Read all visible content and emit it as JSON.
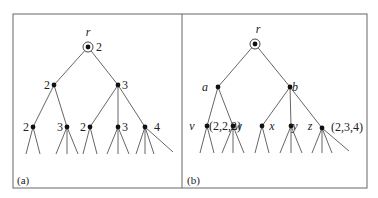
{
  "figure": {
    "frame": {
      "x": 13,
      "y": 14,
      "width": 354,
      "height": 174,
      "divider_x": 182
    },
    "panels": [
      {
        "id": "a",
        "caption": "(a)",
        "caption_pos": [
          17,
          184
        ],
        "nodes": [
          {
            "id": "r",
            "x": 88,
            "y": 47,
            "root": true,
            "label": "r",
            "label_pos": [
              88,
              36
            ],
            "label_style": "italic",
            "value": "2",
            "value_pos": [
              96,
              51
            ]
          },
          {
            "id": "L",
            "x": 54,
            "y": 85,
            "value": "2",
            "value_pos": [
              44,
              89
            ]
          },
          {
            "id": "R",
            "x": 118,
            "y": 85,
            "value": "3",
            "value_pos": [
              122,
              89
            ]
          },
          {
            "id": "LL",
            "x": 33,
            "y": 127,
            "value": "2",
            "value_pos": [
              23,
              131
            ]
          },
          {
            "id": "LR",
            "x": 67,
            "y": 127,
            "value": "3",
            "value_pos": [
              57,
              131
            ]
          },
          {
            "id": "RL",
            "x": 90,
            "y": 127,
            "value": "2",
            "value_pos": [
              80,
              131
            ]
          },
          {
            "id": "RM",
            "x": 118,
            "y": 127,
            "value": "3",
            "value_pos": [
              122,
              131
            ]
          },
          {
            "id": "RR",
            "x": 145,
            "y": 127,
            "value": "4",
            "value_pos": [
              154,
              131
            ]
          }
        ],
        "edges": [
          [
            "r",
            "L"
          ],
          [
            "r",
            "R"
          ],
          [
            "L",
            "LL"
          ],
          [
            "L",
            "LR"
          ],
          [
            "R",
            "RL"
          ],
          [
            "R",
            "RM"
          ],
          [
            "R",
            "RR"
          ]
        ],
        "leaf_stubs": [
          {
            "from": "LL",
            "dx": [
              -7,
              7
            ],
            "len": 27
          },
          {
            "from": "LR",
            "dx": [
              -11,
              0,
              11
            ],
            "len": 27
          },
          {
            "from": "RL",
            "dx": [
              -7,
              7
            ],
            "len": 27
          },
          {
            "from": "RM",
            "dx": [
              -11,
              0,
              11
            ],
            "len": 27
          },
          {
            "from": "RR",
            "dx": [
              -9,
              0,
              9,
              28
            ],
            "len": 27
          }
        ]
      },
      {
        "id": "b",
        "caption": "(b)",
        "caption_pos": [
          187,
          184
        ],
        "nodes": [
          {
            "id": "r",
            "x": 255,
            "y": 44,
            "root": true,
            "label": "r",
            "label_pos": [
              258,
              33
            ],
            "label_style": "italic"
          },
          {
            "id": "a",
            "x": 218,
            "y": 87,
            "label": "a",
            "label_pos": [
              205,
              91
            ],
            "label_style": "italic"
          },
          {
            "id": "b",
            "x": 290,
            "y": 87,
            "label": "b",
            "label_pos": [
              295,
              91
            ],
            "label_style": "italic"
          },
          {
            "id": "v",
            "x": 207,
            "y": 126,
            "label": "v",
            "label_pos": [
              192,
              130
            ],
            "label_style": "italic",
            "value": "(2,2,2)",
            "value_pos": [
              209,
              130
            ]
          },
          {
            "id": "w",
            "x": 233,
            "y": 126,
            "label": "w",
            "label_pos": [
              238,
              130
            ],
            "label_style": "italic"
          },
          {
            "id": "x",
            "x": 262,
            "y": 126,
            "label": "x",
            "label_pos": [
              272,
              130
            ],
            "label_style": "italic"
          },
          {
            "id": "y",
            "x": 291,
            "y": 126,
            "label": "y",
            "label_pos": [
              295,
              130
            ],
            "label_style": "italic"
          },
          {
            "id": "z",
            "x": 322,
            "y": 128,
            "label": "z",
            "label_pos": [
              310,
              130
            ],
            "label_style": "italic",
            "value": "(2,3,4)",
            "value_pos": [
              331,
              131
            ]
          }
        ],
        "edges": [
          [
            "r",
            "a"
          ],
          [
            "r",
            "b"
          ],
          [
            "a",
            "v"
          ],
          [
            "a",
            "w"
          ],
          [
            "b",
            "x"
          ],
          [
            "b",
            "y"
          ],
          [
            "b",
            "z"
          ]
        ],
        "leaf_stubs": [
          {
            "from": "v",
            "dx": [
              -7,
              7
            ],
            "len": 27
          },
          {
            "from": "w",
            "dx": [
              -11,
              0,
              11
            ],
            "len": 27
          },
          {
            "from": "x",
            "dx": [
              -7,
              7
            ],
            "len": 27
          },
          {
            "from": "y",
            "dx": [
              -11,
              0,
              11
            ],
            "len": 27
          },
          {
            "from": "z",
            "dx": [
              -10,
              0,
              10,
              27
            ],
            "len": 25
          }
        ]
      }
    ]
  }
}
